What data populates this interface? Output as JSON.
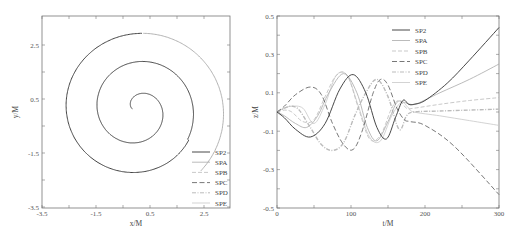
{
  "chart_data": [
    {
      "type": "line",
      "title": "",
      "xlabel": "x/M",
      "ylabel": "y/M",
      "xlim": [
        -3.5,
        3.46
      ],
      "ylim": [
        -3.5,
        3.57
      ],
      "xticks": [
        "-3.5",
        "-1.5",
        "0.5",
        "2.5"
      ],
      "yticks": [
        "-3.5",
        "-1.5",
        "0.5",
        "2.5"
      ],
      "grid": false,
      "legend_position": "lower right",
      "legend": [
        "SP2",
        "SPA",
        "SPB",
        "SPC",
        "SPD",
        "SPE"
      ],
      "series": [
        {
          "name": "SP2",
          "description": "inspiral orbit in x-y plane, all series overlap",
          "x_start": 0.0,
          "y_start": 0.0,
          "x_end": 3.17,
          "y_end": -0.02,
          "max_radius": 3.1,
          "turns": 2.6
        }
      ]
    },
    {
      "type": "line",
      "title": "",
      "xlabel": "t/M",
      "ylabel": "z/M",
      "xlim": [
        0,
        300
      ],
      "ylim": [
        -0.5,
        0.5
      ],
      "xticks": [
        "0",
        "100",
        "200",
        "300"
      ],
      "yticks": [
        "-0.5",
        "-0.3",
        "-0.1",
        "0.1",
        "0.3",
        "0.5"
      ],
      "grid": false,
      "legend_position": "upper center",
      "legend": [
        "SP2",
        "SPA",
        "SPB",
        "SPC",
        "SPD",
        "SPE"
      ],
      "series": [
        {
          "name": "SP2",
          "t": [
            0,
            10,
            25,
            45,
            65,
            85,
            103,
            120,
            135,
            148,
            160,
            170,
            178,
            185,
            200,
            230,
            260,
            300
          ],
          "z": [
            0,
            -0.03,
            -0.09,
            -0.13,
            -0.06,
            0.12,
            0.195,
            0.1,
            -0.08,
            -0.14,
            -0.03,
            0.06,
            0.04,
            0.04,
            0.06,
            0.15,
            0.27,
            0.44
          ]
        },
        {
          "name": "SPA",
          "t": [
            0,
            10,
            25,
            40,
            55,
            70,
            90,
            108,
            122,
            135,
            150,
            162,
            172,
            180,
            190,
            220,
            260,
            300
          ],
          "z": [
            0,
            -0.02,
            -0.06,
            -0.08,
            -0.02,
            0.1,
            0.2,
            0.1,
            -0.08,
            -0.15,
            -0.05,
            0.05,
            0.05,
            0.04,
            0.045,
            0.1,
            0.17,
            0.25
          ]
        },
        {
          "name": "SPB",
          "t": [
            0,
            10,
            20,
            35,
            50,
            65,
            80,
            95,
            110,
            125,
            140,
            155,
            165,
            175,
            185,
            220,
            260,
            300
          ],
          "z": [
            0,
            0.01,
            0.0,
            -0.05,
            -0.04,
            0.08,
            0.19,
            0.19,
            0.02,
            -0.14,
            -0.12,
            0.02,
            0.06,
            0.02,
            0.02,
            0.04,
            0.06,
            0.075
          ]
        },
        {
          "name": "SPC",
          "t": [
            0,
            10,
            25,
            45,
            60,
            75,
            90,
            103,
            115,
            130,
            140,
            150,
            162,
            172,
            180,
            200,
            240,
            300
          ],
          "z": [
            0,
            0.03,
            0.09,
            0.13,
            0.09,
            -0.06,
            -0.17,
            -0.195,
            -0.1,
            0.1,
            0.17,
            0.14,
            0.02,
            -0.04,
            -0.05,
            -0.07,
            -0.18,
            -0.43
          ]
        },
        {
          "name": "SPD",
          "t": [
            0,
            10,
            20,
            30,
            45,
            60,
            75,
            90,
            105,
            120,
            135,
            150,
            165,
            175,
            185,
            220,
            260,
            300
          ],
          "z": [
            0,
            0.02,
            0.03,
            0.01,
            -0.08,
            -0.17,
            -0.2,
            -0.16,
            -0.02,
            0.1,
            0.17,
            0.08,
            -0.09,
            -0.02,
            0.0,
            0.005,
            0.01,
            0.015
          ]
        },
        {
          "name": "SPE",
          "t": [
            0,
            10,
            20,
            35,
            50,
            65,
            80,
            95,
            110,
            125,
            140,
            155,
            168,
            178,
            185,
            220,
            260,
            300
          ],
          "z": [
            0,
            0.02,
            0.03,
            0.02,
            -0.06,
            0.04,
            0.19,
            0.19,
            0.03,
            -0.13,
            -0.15,
            -0.02,
            0.05,
            0.02,
            0.0,
            -0.02,
            -0.045,
            -0.07
          ]
        }
      ]
    }
  ],
  "styles": {
    "SP2": {
      "color": "#333333",
      "dash": "",
      "width": 0.9
    },
    "SPA": {
      "color": "#aaaaaa",
      "dash": "",
      "width": 0.8
    },
    "SPB": {
      "color": "#bbbbbb",
      "dash": "4 2",
      "width": 0.8
    },
    "SPC": {
      "color": "#555555",
      "dash": "5 2.5",
      "width": 0.8
    },
    "SPD": {
      "color": "#bbbbbb",
      "dash": "4 1.5 1 1.5",
      "width": 1.4
    },
    "SPE": {
      "color": "#c8c8c8",
      "dash": "",
      "width": 0.8
    }
  }
}
